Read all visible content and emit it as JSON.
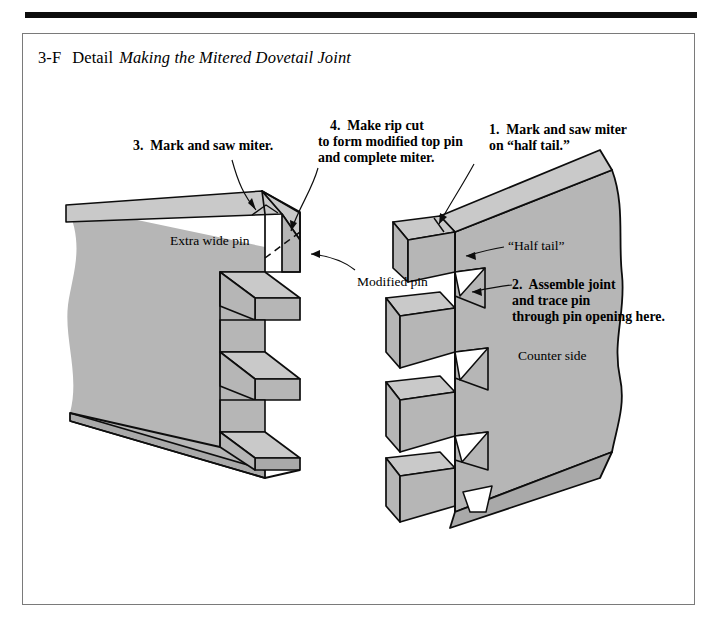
{
  "figure": {
    "number": "3-F",
    "kind": "Detail",
    "title": "Making the Mitered Dovetail Joint"
  },
  "colors": {
    "wood_face": "#b6b6b6",
    "wood_top": "#c9c9c9",
    "wood_end": "#bdbdbd",
    "outline": "#0d0d0d",
    "rule": "#0d0d0d",
    "box_border": "#7a7a7a",
    "page": "#ffffff"
  },
  "callouts": {
    "step3": "3.  Mark and saw miter.",
    "step4_line1": "4.  Make rip cut",
    "step4_line2": "to form modified top pin",
    "step4_line3": "and complete miter.",
    "step1_line1": "1.  Mark and saw miter",
    "step1_line2": "on “half tail.”",
    "step2_line1": "2.  Assemble joint",
    "step2_line2": "and trace pin",
    "step2_line3": "through pin opening here."
  },
  "labels": {
    "extra_wide_pin": "Extra wide pin",
    "modified_pin": "Modified pin",
    "half_tail": "“Half tail”",
    "counter_side": "Counter side"
  },
  "parts": {
    "left_board": "pin-board",
    "right_board": "tail-board",
    "left_pin_count": 3,
    "right_tail_count": 4,
    "rip_cut_line_style": "dashed"
  }
}
